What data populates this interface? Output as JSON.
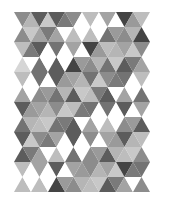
{
  "pattern": {
    "name": "Gray triangle mosaic",
    "origin": [
      14,
      12
    ],
    "tri_width": 17,
    "row_height": 15,
    "cols": 16,
    "palette": {
      "W": "#ffffff",
      "1": "#d6d6d6",
      "2": "#bdbdbd",
      "3": "#a3a3a3",
      "4": "#8c8c8c",
      "5": "#737373",
      "6": "#5c5c5c",
      "7": "#444444"
    },
    "rows": [
      "4W6W6W4W2W3W7W2W",
      "4W3W3W2W2W5W4W7W",
      "2W6W5W3W7W2W3W4W",
      "1W5W6W7W4W5W6W3W",
      "2W5W6W3W5W4W5W2W",
      "3W4W5W6W2W6W3W5W",
      "6W3W4W2W5W5W6W3W",
      "5W2W5W6W3W2W4W6W",
      "6W4W3W6W4W3W6W2W",
      "6W3W2W5W4W6W2W4W",
      "2W3W6W3W4W3W7W5W",
      "2W2W7W4W2W6W3W4W"
    ]
  }
}
